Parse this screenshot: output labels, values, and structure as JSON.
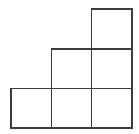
{
  "figure": {
    "name": "staircase-polyomino",
    "title": "Staircase figure of six unit squares",
    "square_count": 6,
    "row_counts": [
      1,
      2,
      3
    ],
    "background_color": "#ffffff",
    "line_color": "#3c3c3c",
    "line_width": 1.6,
    "canvas": {
      "width": 139,
      "height": 134
    },
    "grid": {
      "origin_x": 11,
      "origin_y": 9,
      "cell_size": 40.3,
      "columns": 3,
      "rows": 3,
      "x_lines": [
        11,
        51.3,
        91.7,
        132
      ],
      "y_lines": [
        9,
        48.7,
        88.3,
        128
      ]
    },
    "cells": [
      {
        "id": "cell-r1c3",
        "row": 1,
        "col": 3,
        "x": 91.7,
        "y": 9,
        "w": 40.3,
        "h": 39.7
      },
      {
        "id": "cell-r2c2",
        "row": 2,
        "col": 2,
        "x": 51.3,
        "y": 48.7,
        "w": 40.4,
        "h": 39.6
      },
      {
        "id": "cell-r2c3",
        "row": 2,
        "col": 3,
        "x": 91.7,
        "y": 48.7,
        "w": 40.3,
        "h": 39.6
      },
      {
        "id": "cell-r3c1",
        "row": 3,
        "col": 1,
        "x": 11,
        "y": 88.3,
        "w": 40.3,
        "h": 39.7
      },
      {
        "id": "cell-r3c2",
        "row": 3,
        "col": 2,
        "x": 51.3,
        "y": 88.3,
        "w": 40.4,
        "h": 39.7
      },
      {
        "id": "cell-r3c3",
        "row": 3,
        "col": 3,
        "x": 91.7,
        "y": 88.3,
        "w": 40.3,
        "h": 39.7
      }
    ]
  }
}
